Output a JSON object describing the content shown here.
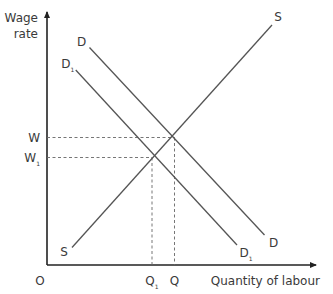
{
  "chart_data": {
    "type": "line",
    "title": "",
    "xlabel": "Quantity of labour",
    "ylabel": [
      "Wage",
      "rate"
    ],
    "origin_label": "O",
    "xlim": [
      0,
      10
    ],
    "ylim": [
      0,
      10
    ],
    "grid": false,
    "series": [
      {
        "name": "S",
        "label_start": "S",
        "label_end": "S",
        "points": [
          [
            1.0,
            0.7
          ],
          [
            9.0,
            9.6
          ]
        ]
      },
      {
        "name": "D",
        "label_start": "D",
        "label_end": "D",
        "points": [
          [
            1.7,
            8.7
          ],
          [
            8.7,
            1.2
          ]
        ]
      },
      {
        "name": "D1",
        "label_start": "D",
        "label_start_sub": "1",
        "label_end": "D",
        "label_end_sub": "1",
        "points": [
          [
            1.15,
            7.8
          ],
          [
            7.6,
            0.8
          ]
        ]
      }
    ],
    "equilibria": [
      {
        "name": "original",
        "x": 5.1,
        "y": 5.1,
        "x_label": "Q",
        "x_label_sub": "",
        "y_label": "W",
        "y_label_sub": ""
      },
      {
        "name": "new",
        "x": 4.2,
        "y": 4.3,
        "x_label": "Q",
        "x_label_sub": "1",
        "y_label": "W",
        "y_label_sub": "1"
      }
    ]
  }
}
